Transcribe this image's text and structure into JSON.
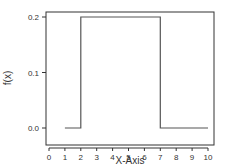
{
  "chart_data": {
    "type": "line",
    "title": "",
    "xlabel": "X-Axis",
    "ylabel": "f(x)",
    "xlim": [
      0,
      10
    ],
    "ylim": [
      0.0,
      0.2
    ],
    "x_ticks": [
      0,
      1,
      2,
      3,
      4,
      5,
      6,
      7,
      8,
      9,
      10
    ],
    "x_tick_labels": [
      "0",
      "1",
      "2",
      "3",
      "4",
      "5",
      "6",
      "7",
      "8",
      "9",
      "10"
    ],
    "y_ticks": [
      0.0,
      0.1,
      0.2
    ],
    "y_tick_labels": [
      "0.0",
      "0.1",
      "0.2"
    ],
    "grid": false,
    "legend": null,
    "series": [
      {
        "name": "f(x)",
        "style": "step",
        "color": "#555555",
        "x": [
          1,
          2,
          2,
          7,
          7,
          10
        ],
        "y": [
          0.0,
          0.0,
          0.2,
          0.2,
          0.0,
          0.0
        ]
      }
    ]
  },
  "colors": {
    "axis": "#333333",
    "line": "#555555",
    "background": "#ffffff"
  }
}
